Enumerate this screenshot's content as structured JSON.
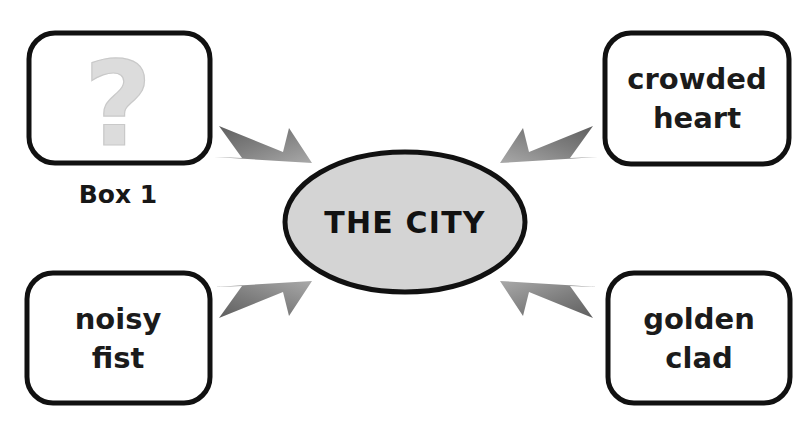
{
  "diagram": {
    "type": "concept-map",
    "background_color": "#ffffff",
    "center": {
      "label": "THE CITY",
      "shape": "ellipse",
      "fill_color": "#d4d4d4",
      "border_color": "#111111"
    },
    "edge_style": {
      "shape": "tapered-arrow",
      "color": "#6f6f6f",
      "direction": "center-to-node"
    },
    "nodes": [
      {
        "id": "top-left",
        "position": "top-left",
        "line1": "?",
        "line2": "",
        "is_placeholder": true,
        "icon": "question-mark-icon",
        "icon_color": "#dcdcdc",
        "caption": "Box 1",
        "border_color": "#111111",
        "fill_color": "#ffffff"
      },
      {
        "id": "top-right",
        "position": "top-right",
        "line1": "crowded",
        "line2": "heart",
        "is_placeholder": false,
        "caption": "",
        "border_color": "#111111",
        "fill_color": "#ffffff"
      },
      {
        "id": "bottom-left",
        "position": "bottom-left",
        "line1": "noisy",
        "line2": "fist",
        "is_placeholder": false,
        "caption": "",
        "border_color": "#111111",
        "fill_color": "#ffffff"
      },
      {
        "id": "bottom-right",
        "position": "bottom-right",
        "line1": "golden",
        "line2": "clad",
        "is_placeholder": false,
        "caption": "",
        "border_color": "#111111",
        "fill_color": "#ffffff"
      }
    ]
  }
}
